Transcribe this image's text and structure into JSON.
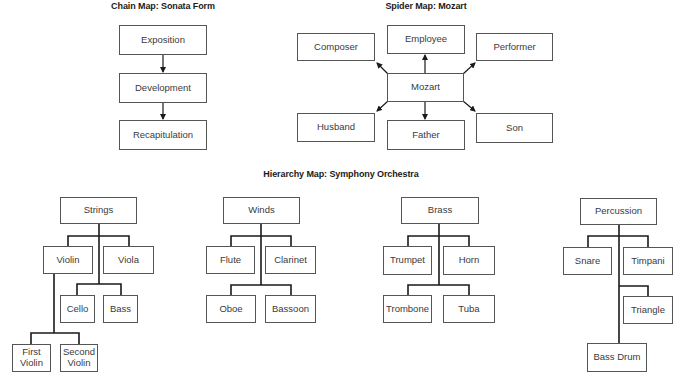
{
  "chain_map": {
    "title": "Chain Map: Sonata Form",
    "steps": [
      "Exposition",
      "Development",
      "Recapitulation"
    ]
  },
  "spider_map": {
    "title": "Spider Map: Mozart",
    "center": "Mozart",
    "nodes": {
      "top": "Employee",
      "top_left": "Composer",
      "top_right": "Performer",
      "bottom": "Father",
      "bottom_left": "Husband",
      "bottom_right": "Son"
    }
  },
  "hierarchy_map": {
    "title": "Hierarchy Map: Symphony Orchestra",
    "groups": [
      {
        "name": "Strings",
        "children": [
          "Violin",
          "Viola",
          "Cello",
          "Bass"
        ],
        "violin_children": [
          "First Violin",
          "Second Violin"
        ]
      },
      {
        "name": "Winds",
        "children": [
          "Flute",
          "Clarinet",
          "Oboe",
          "Bassoon"
        ]
      },
      {
        "name": "Brass",
        "children": [
          "Trumpet",
          "Horn",
          "Trombone",
          "Tuba"
        ]
      },
      {
        "name": "Percussion",
        "children": [
          "Snare",
          "Timpani",
          "Triangle",
          "Bass Drum"
        ]
      }
    ]
  },
  "colors": {
    "line": "#1a1a1a",
    "box_border": "#555555",
    "text": "#3a3a3a"
  }
}
